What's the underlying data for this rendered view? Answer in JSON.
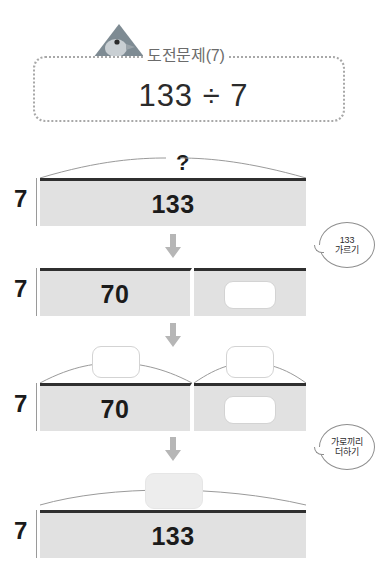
{
  "header": {
    "icon": "birdhouse-icon",
    "title": "도전문제(7)",
    "expression": "133 ÷ 7"
  },
  "stages": [
    {
      "id": "stage-total",
      "top_label": "?",
      "side_label": "7",
      "segments": [
        {
          "value": "133",
          "slot": null
        }
      ]
    },
    {
      "id": "stage-split",
      "side_label": "7",
      "segments": [
        {
          "value": "70",
          "slot": null
        },
        {
          "value": "",
          "slot": "empty"
        }
      ]
    },
    {
      "id": "stage-partial-quotients",
      "side_label": "7",
      "top_slots": [
        "",
        ""
      ],
      "segments": [
        {
          "value": "70",
          "slot": null
        },
        {
          "value": "",
          "slot": "empty"
        }
      ]
    },
    {
      "id": "stage-answer",
      "side_label": "7",
      "top_slots": [
        ""
      ],
      "segments": [
        {
          "value": "133",
          "slot": null
        }
      ]
    }
  ],
  "bubbles": [
    {
      "id": "bubble-decompose",
      "line1": "133",
      "line2": "가르기"
    },
    {
      "id": "bubble-add-across",
      "line1": "가로끼리",
      "line2": "더하기"
    }
  ],
  "arrows": {
    "glyph": "down-arrow",
    "count": 3
  }
}
